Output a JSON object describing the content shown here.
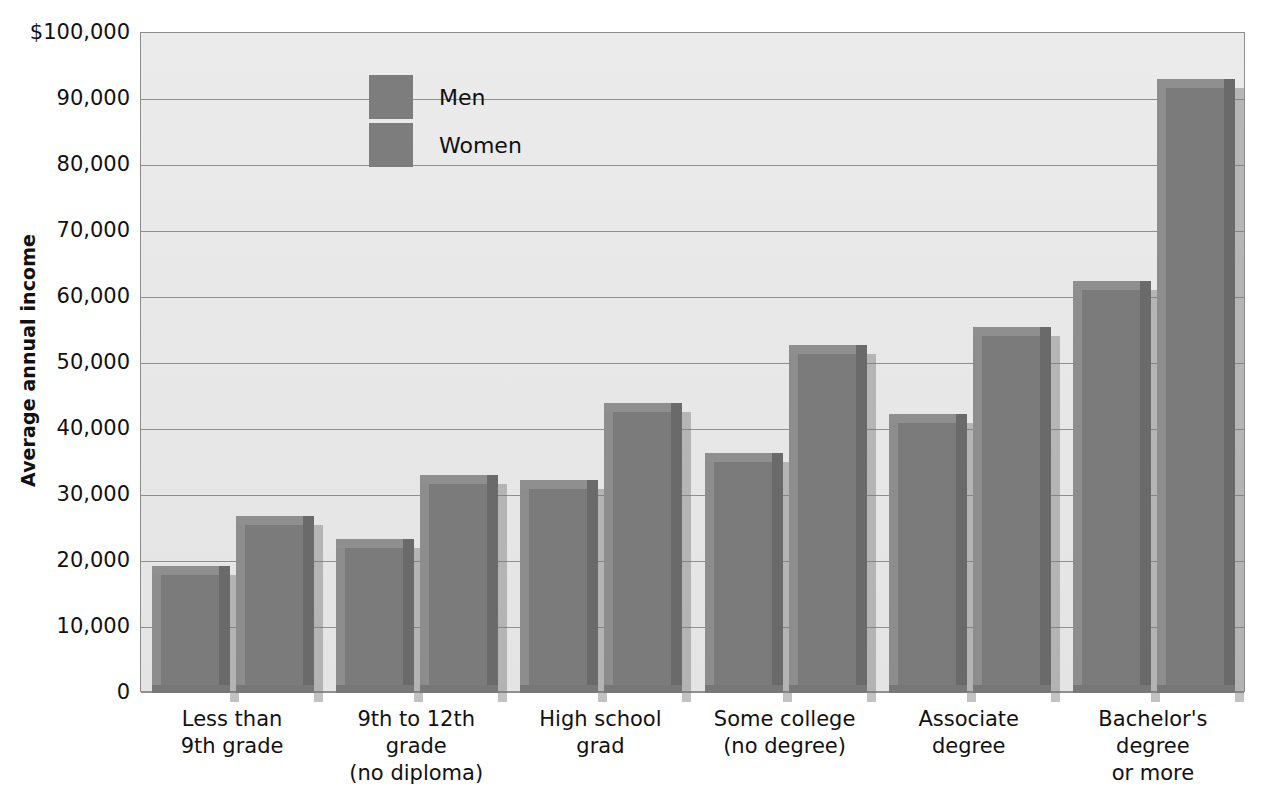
{
  "chart_data": {
    "type": "bar",
    "title": "",
    "subtitle": "",
    "xlabel": "",
    "ylabel": "Average annual income",
    "ylim": [
      0,
      100000
    ],
    "ytick_values": [
      0,
      10000,
      20000,
      30000,
      40000,
      50000,
      60000,
      70000,
      80000,
      90000,
      100000
    ],
    "ytick_labels": [
      "0",
      "10,000",
      "20,000",
      "30,000",
      "40,000",
      "50,000",
      "60,000",
      "70,000",
      "80,000",
      "90,000",
      "$100,000"
    ],
    "grid": true,
    "legend_position": "upper-left-inside",
    "categories": [
      "Less than 9th grade",
      "9th to 12th grade (no diploma)",
      "High school grad",
      "Some college (no degree)",
      "Associate degree",
      "Bachelor's degree or more"
    ],
    "category_lines": [
      [
        "Less than",
        "9th grade"
      ],
      [
        "9th to 12th",
        "grade",
        "(no diploma)"
      ],
      [
        "High school",
        "grad"
      ],
      [
        "Some college",
        "(no degree)"
      ],
      [
        "Associate",
        "degree"
      ],
      [
        "Bachelor's",
        "degree",
        "or more"
      ]
    ],
    "series": [
      {
        "name": "Men",
        "values": [
          19300,
          23400,
          32200,
          36400,
          42300,
          62500
        ]
      },
      {
        "name": "Women",
        "values": [
          26800,
          33100,
          44000,
          52800,
          55500,
          93000
        ]
      }
    ],
    "bar_color": "#7b7b7b",
    "plot_background": "#e8e8e8",
    "gridline_color": "#8f8f8f",
    "axis_color": "#8c8c8c",
    "text_color": "#111111"
  },
  "legend": {
    "items": [
      {
        "label": "Men",
        "color": "#7d7d7d"
      },
      {
        "label": "Women",
        "color": "#7d7d7d"
      }
    ]
  }
}
